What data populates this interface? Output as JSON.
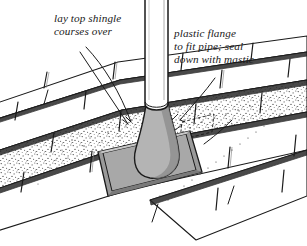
{
  "illustration": {
    "title": "Roof pipe flashing detail",
    "background_color": "#ffffff",
    "ink_color": "#1a1a1a",
    "flange_fill_color": "#a8a8a8",
    "boot_fill_color": "#b4b4b4",
    "shingle_fill_color": "#ffffff",
    "granule_stipple_color": "#3a3a3a"
  },
  "callouts": {
    "left": {
      "name": "lay-top-shingle-courses-over",
      "line1": "lay top shingle",
      "line2": "courses over"
    },
    "right": {
      "name": "plastic-flange-to-fit-pipe",
      "line1": "plastic flange",
      "line2": "to fit pipe; seal",
      "line3": "down with mastic"
    }
  },
  "parts": {
    "pipe": "vent-pipe",
    "boot": "plastic-flange-boot",
    "plate": "flange-base-plate",
    "shingles": "asphalt-shingle-courses",
    "granules": "granule-stipple-texture"
  }
}
